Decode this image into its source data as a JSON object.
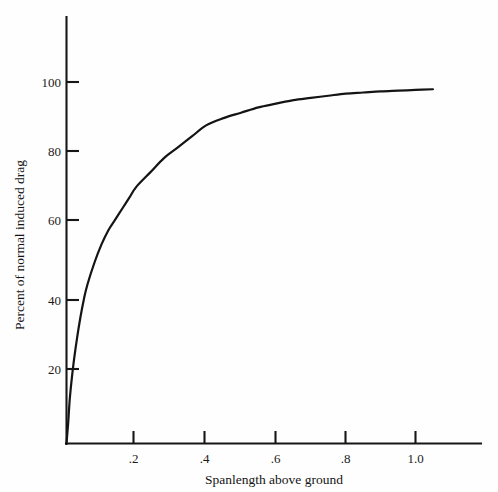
{
  "chart_data": {
    "type": "line",
    "title": "",
    "subtitle": "",
    "xlabel": "Spanlength above ground",
    "ylabel": "Percent of normal induced drag",
    "xlim": [
      0,
      1.2
    ],
    "ylim": [
      0,
      110
    ],
    "grid": false,
    "legend": null,
    "x_ticks": [
      {
        "value": 0.2,
        "label": ".2"
      },
      {
        "value": 0.4,
        "label": ".4"
      },
      {
        "value": 0.6,
        "label": ".6"
      },
      {
        "value": 0.8,
        "label": ".8"
      },
      {
        "value": 1.0,
        "label": "1.0"
      }
    ],
    "y_ticks": [
      {
        "value": 20,
        "label": "20"
      },
      {
        "value": 40,
        "label": "40"
      },
      {
        "value": 60,
        "label": "60"
      },
      {
        "value": 80,
        "label": "80"
      },
      {
        "value": 100,
        "label": "100"
      }
    ],
    "series": [
      {
        "name": "induced drag in ground effect",
        "x": [
          0.0,
          0.005,
          0.01,
          0.02,
          0.03,
          0.04,
          0.05,
          0.06,
          0.08,
          0.1,
          0.12,
          0.14,
          0.16,
          0.18,
          0.2,
          0.24,
          0.28,
          0.32,
          0.36,
          0.4,
          0.45,
          0.5,
          0.55,
          0.6,
          0.65,
          0.7,
          0.75,
          0.8,
          0.85,
          0.9,
          0.95,
          1.0,
          1.05
        ],
        "y": [
          0,
          6,
          13,
          22,
          29,
          35,
          40,
          44,
          50,
          55,
          59,
          62,
          65,
          68,
          71,
          75,
          79,
          82,
          85,
          88,
          90,
          91.5,
          93,
          94,
          95,
          95.6,
          96.2,
          96.8,
          97.1,
          97.4,
          97.6,
          97.8,
          98.0
        ]
      }
    ]
  },
  "axes": {
    "x_axis_name": "x-axis",
    "y_axis_name": "y-axis"
  }
}
